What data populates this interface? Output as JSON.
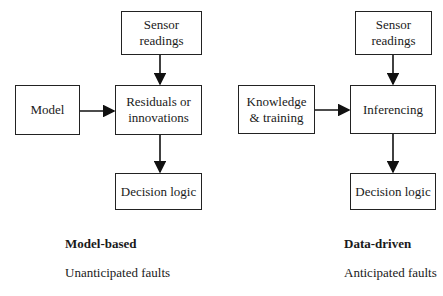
{
  "left": {
    "sensor": "Sensor readings",
    "model": "Model",
    "residuals": "Residuals or innovations",
    "decision": "Decision logic",
    "title": "Model-based",
    "subtitle": "Unanticipated faults"
  },
  "right": {
    "sensor": "Sensor readings",
    "knowledge": "Knowledge & training",
    "inferencing": "Inferencing",
    "decision": "Decision logic",
    "title": "Data-driven",
    "subtitle": "Anticipated faults"
  }
}
